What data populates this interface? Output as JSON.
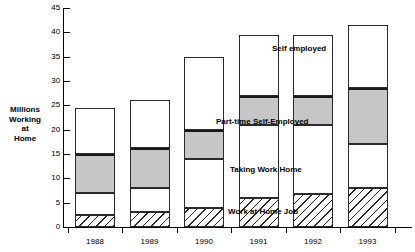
{
  "chart_data": {
    "type": "bar",
    "title": "",
    "subtitle": "",
    "xlabel": "",
    "ylabel": "Millions Working at Home",
    "ylabel_lines": [
      "Millions",
      "Working",
      "at",
      "Home"
    ],
    "categories": [
      "1988",
      "1989",
      "1990",
      "1991",
      "1992",
      "1993"
    ],
    "ylim": [
      0,
      45
    ],
    "yticks": [
      0,
      5,
      10,
      15,
      20,
      25,
      30,
      35,
      40,
      45
    ],
    "ytick_labels": [
      "0",
      "5",
      "10",
      "15",
      "20",
      "25",
      "30",
      "35",
      "40",
      "45"
    ],
    "grid": false,
    "stacked": true,
    "legend_position": "inline-callouts",
    "series": [
      {
        "name": "Work at Home Job",
        "fill": "hatched",
        "values": [
          2.5,
          3.0,
          4.0,
          6.0,
          6.8,
          8.0
        ]
      },
      {
        "name": "Taking Work Home",
        "fill": "white",
        "values": [
          4.5,
          5.0,
          10.0,
          15.0,
          14.2,
          9.0
        ]
      },
      {
        "name": "Part-time Self-Employed",
        "fill": "gray",
        "values": [
          8.0,
          8.3,
          6.0,
          6.0,
          6.0,
          11.5
        ]
      },
      {
        "name": "Self employed",
        "fill": "white",
        "values": [
          9.5,
          9.7,
          15.0,
          12.5,
          12.5,
          13.0
        ]
      }
    ],
    "totals": [
      24.5,
      26.0,
      35.0,
      39.5,
      39.5,
      41.5
    ],
    "annotations": [
      {
        "text": "Self employed",
        "series": "Self employed"
      },
      {
        "text": "Part-time Self-Employed",
        "series": "Part-time Self-Employed"
      },
      {
        "text": "Taking Work Home",
        "series": "Taking Work Home"
      },
      {
        "text": "Work at Home Job",
        "series": "Work at Home Job"
      }
    ],
    "colors": {
      "gray_fill": "#c6c6c6",
      "white_fill": "#ffffff",
      "outline": "#2b2b2b",
      "background": "#ffffff"
    }
  }
}
